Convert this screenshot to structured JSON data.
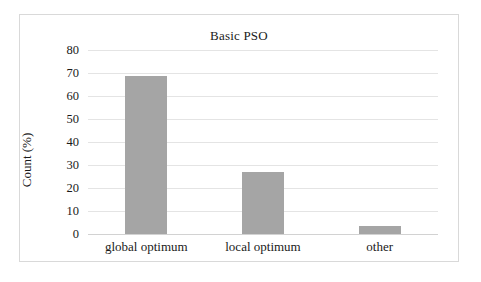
{
  "chart_data": {
    "type": "bar",
    "title": "Basic PSO",
    "xlabel": "",
    "ylabel": "Count (%)",
    "categories": [
      "global optimum",
      "local optimum",
      "other"
    ],
    "values": [
      68.5,
      27,
      3.5
    ],
    "series": [
      {
        "name": "Count (%)",
        "values": [
          68.5,
          27,
          3.5
        ],
        "color": "#a5a5a5"
      }
    ],
    "ylim": [
      0,
      80
    ],
    "ytick_step": 10,
    "yticks": [
      80,
      70,
      60,
      50,
      40,
      30,
      20,
      10,
      0
    ],
    "ytick_labels": [
      "80",
      "70",
      "60",
      "50",
      "40",
      "30",
      "20",
      "10",
      "0"
    ],
    "grid": true,
    "grid_axis": "y",
    "legend": false,
    "legend_position": "none",
    "bar_color": "#a5a5a5",
    "gridline_color": "#e4e4e4",
    "frame_color": "#d9d9d9"
  }
}
